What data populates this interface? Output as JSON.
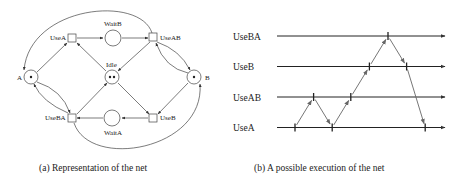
{
  "figure_a": {
    "caption": "(a) Representation of the net",
    "places": [
      {
        "id": "A",
        "label": "A",
        "tokens": 1
      },
      {
        "id": "B",
        "label": "B",
        "tokens": 1
      },
      {
        "id": "Idle",
        "label": "Idle",
        "tokens": 2
      },
      {
        "id": "WaitB",
        "label": "WaitB",
        "tokens": 0
      },
      {
        "id": "WaitA",
        "label": "WaitA",
        "tokens": 0
      }
    ],
    "transitions": [
      {
        "id": "UseA",
        "label": "UseA"
      },
      {
        "id": "UseAB",
        "label": "UseAB"
      },
      {
        "id": "UseB",
        "label": "UseB"
      },
      {
        "id": "UseBA",
        "label": "UseBA"
      }
    ],
    "arcs": [
      {
        "from": "A",
        "to": "UseA"
      },
      {
        "from": "Idle",
        "to": "UseA"
      },
      {
        "from": "UseA",
        "to": "WaitB"
      },
      {
        "from": "WaitB",
        "to": "UseAB"
      },
      {
        "from": "UseAB",
        "to": "Idle"
      },
      {
        "from": "UseAB",
        "to": "B"
      },
      {
        "from": "B",
        "to": "UseAB"
      },
      {
        "from": "UseAB",
        "to": "A"
      },
      {
        "from": "B",
        "to": "UseB"
      },
      {
        "from": "Idle",
        "to": "UseB"
      },
      {
        "from": "UseB",
        "to": "WaitA"
      },
      {
        "from": "WaitA",
        "to": "UseBA"
      },
      {
        "from": "UseBA",
        "to": "Idle"
      },
      {
        "from": "UseBA",
        "to": "A"
      },
      {
        "from": "A",
        "to": "UseBA"
      },
      {
        "from": "UseBA",
        "to": "B"
      }
    ]
  },
  "figure_b": {
    "caption": "(b) A possible execution of the net",
    "timelines": [
      "UseBA",
      "UseB",
      "UseAB",
      "UseA"
    ],
    "events": [
      {
        "id": "e1",
        "line": "UseA",
        "order": 1
      },
      {
        "id": "e2",
        "line": "UseAB",
        "order": 2
      },
      {
        "id": "e3",
        "line": "UseA",
        "order": 3
      },
      {
        "id": "e4",
        "line": "UseAB",
        "order": 4
      },
      {
        "id": "e5",
        "line": "UseB",
        "order": 5
      },
      {
        "id": "e6",
        "line": "UseBA",
        "order": 6
      },
      {
        "id": "e7",
        "line": "UseB",
        "order": 7
      },
      {
        "id": "e8",
        "line": "UseA",
        "order": 8
      }
    ],
    "causal_arrows": [
      {
        "from": "e1",
        "to": "e2"
      },
      {
        "from": "e2",
        "to": "e3"
      },
      {
        "from": "e3",
        "to": "e4"
      },
      {
        "from": "e4",
        "to": "e5"
      },
      {
        "from": "e5",
        "to": "e6"
      },
      {
        "from": "e6",
        "to": "e7"
      },
      {
        "from": "e7",
        "to": "e8"
      }
    ]
  }
}
